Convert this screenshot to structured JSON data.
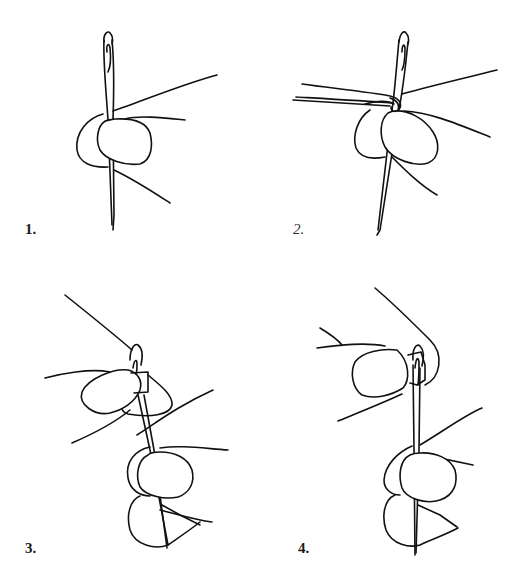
{
  "figure": {
    "stroke_color": "#111111",
    "background": "#ffffff",
    "panels": [
      {
        "step": 1,
        "label": "1.",
        "subject": "needle held between thumb and finger, eye up"
      },
      {
        "step": 2,
        "label": "2.",
        "subject": "thread folded over needle shaft and pinched tight"
      },
      {
        "step": 3,
        "label": "3.",
        "subject": "needle withdrawn; folded thread pinched; eye pressed onto fold"
      },
      {
        "step": 4,
        "label": "4.",
        "subject": "thread loop pushed through the needle eye"
      }
    ]
  }
}
